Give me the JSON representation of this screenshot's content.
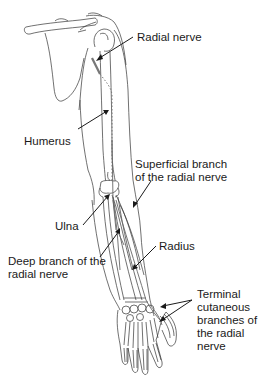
{
  "diagram": {
    "labels": {
      "radial_nerve": "Radial nerve",
      "humerus": "Humerus",
      "superficial_line1": "Superficial branch",
      "superficial_line2": "of the radial nerve",
      "ulna": "Ulna",
      "deep_line1": "Deep branch of the",
      "deep_line2": "radial nerve",
      "radius": "Radius",
      "terminal_line1": "Terminal",
      "terminal_line2": "cutaneous",
      "terminal_line3": "branches of",
      "terminal_line4": "the radial",
      "terminal_line5": "nerve"
    },
    "colors": {
      "line": "#333333",
      "nerve": "#777777",
      "text": "#1a1a1a",
      "background": "#ffffff"
    }
  }
}
